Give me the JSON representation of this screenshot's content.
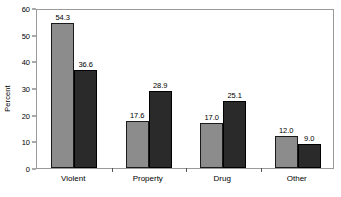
{
  "chart_data": {
    "type": "bar",
    "title": "",
    "subtitle": "",
    "xlabel": "",
    "ylabel": "Percent",
    "categories": [
      "Violent",
      "Property",
      "Drug",
      "Other"
    ],
    "series": [
      {
        "name": "series-1",
        "color": "#8c8c8c",
        "values": [
          54.3,
          17.6,
          17.0,
          12.0
        ],
        "labels": [
          "54.3",
          "17.6",
          "17.0",
          "12.0"
        ]
      },
      {
        "name": "series-2",
        "color": "#2a2a2a",
        "values": [
          36.6,
          28.9,
          25.1,
          9.0
        ],
        "labels": [
          "36.6",
          "28.9",
          "25.1",
          "9.0"
        ]
      }
    ],
    "ylim": [
      0,
      60
    ],
    "yticks": [
      0,
      10,
      20,
      30,
      40,
      50,
      60
    ],
    "ytick_labels": [
      "0",
      "10",
      "20",
      "30",
      "40",
      "50",
      "60"
    ],
    "grid": false,
    "legend": false,
    "legend_position": "none",
    "frame": true,
    "bar_outline_color": "#1a1a1a",
    "frame_color": "#9a9a9a",
    "background": "#ffffff"
  }
}
